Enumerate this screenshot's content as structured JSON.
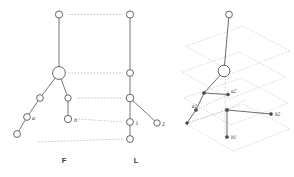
{
  "figure": {
    "title": "",
    "background_color": "#ffffff",
    "stroke_color": "#5a5a5a",
    "dotted_color": "#c0c0c0",
    "panels": [
      {
        "id": "F",
        "label": "F",
        "label_x": 64,
        "label_y": 163
      },
      {
        "id": "L",
        "label": "L",
        "label_x": 136,
        "label_y": 163
      }
    ]
  },
  "panel_f": {
    "name": "F",
    "label": "F",
    "nodes": [
      {
        "id": "f-root",
        "label": "",
        "cx": 59,
        "cy": 14.5,
        "r": 3.6,
        "kind": "circle"
      },
      {
        "id": "f-big",
        "label": "",
        "cx": 59,
        "cy": 73,
        "r": 6.4,
        "kind": "circle"
      },
      {
        "id": "f-mid-l",
        "label": "",
        "cx": 40,
        "cy": 98,
        "r": 3.4,
        "kind": "circle"
      },
      {
        "id": "f-a",
        "label": "a",
        "cx": 27,
        "cy": 117,
        "r": 3.4,
        "kind": "circle"
      },
      {
        "id": "f-leaf-l",
        "label": "",
        "cx": 17,
        "cy": 134,
        "r": 3.4,
        "kind": "circle"
      },
      {
        "id": "f-mid-r",
        "label": "",
        "cx": 68,
        "cy": 98,
        "r": 3.2,
        "kind": "circle"
      },
      {
        "id": "f-b",
        "label": "b",
        "cx": 68,
        "cy": 119,
        "r": 3.6,
        "kind": "circle"
      }
    ],
    "edges": [
      {
        "from": "f-root",
        "to": "f-big"
      },
      {
        "from": "f-big",
        "to": "f-mid-l"
      },
      {
        "from": "f-mid-l",
        "to": "f-a"
      },
      {
        "from": "f-a",
        "to": "f-leaf-l"
      },
      {
        "from": "f-big",
        "to": "f-mid-r"
      },
      {
        "from": "f-mid-r",
        "to": "f-b"
      }
    ],
    "node_labels": [
      {
        "text": "a",
        "x": 32,
        "y": 119.5
      },
      {
        "text": "b",
        "x": 74,
        "y": 121.5
      }
    ]
  },
  "panel_l": {
    "name": "L",
    "label": "L",
    "nodes": [
      {
        "id": "l-root",
        "label": "",
        "cx": 130,
        "cy": 14.5,
        "r": 3.6,
        "kind": "circle"
      },
      {
        "id": "l-n2",
        "label": "",
        "cx": 130,
        "cy": 73,
        "r": 3.4,
        "kind": "circle"
      },
      {
        "id": "l-n3",
        "label": "",
        "cx": 130,
        "cy": 98,
        "r": 3.8,
        "kind": "circle"
      },
      {
        "id": "l-one",
        "label": "1",
        "cx": 130,
        "cy": 122,
        "r": 3.4,
        "kind": "circle"
      },
      {
        "id": "l-bot",
        "label": "",
        "cx": 130,
        "cy": 139,
        "r": 3.4,
        "kind": "circle"
      },
      {
        "id": "l-two",
        "label": "2",
        "cx": 157,
        "cy": 123,
        "r": 3.2,
        "kind": "circle"
      }
    ],
    "edges": [
      {
        "from": "l-root",
        "to": "l-n2"
      },
      {
        "from": "l-n2",
        "to": "l-n3"
      },
      {
        "from": "l-n3",
        "to": "l-one"
      },
      {
        "from": "l-one",
        "to": "l-bot"
      },
      {
        "from": "l-n3",
        "to": "l-two"
      }
    ],
    "node_labels": [
      {
        "text": "1",
        "x": 135.5,
        "y": 124.5
      },
      {
        "text": "2",
        "x": 162,
        "y": 125.5
      }
    ]
  },
  "correspondence_lines": [
    {
      "id": "corr-0",
      "x1": 68,
      "y1": 14.5,
      "x2": 123,
      "y2": 14.5
    },
    {
      "id": "corr-1",
      "x1": 68,
      "y1": 73,
      "x2": 123,
      "y2": 73
    },
    {
      "id": "corr-2",
      "x1": 78,
      "y1": 98,
      "x2": 123,
      "y2": 98
    },
    {
      "id": "corr-3",
      "x1": 78,
      "y1": 119,
      "x2": 123,
      "y2": 122
    },
    {
      "id": "corr-4",
      "x1": 38,
      "y1": 142,
      "x2": 123,
      "y2": 139
    }
  ],
  "panel_3d": {
    "name": "layered-3d-view",
    "planes": [
      {
        "id": "plane-top",
        "points": "186,46 243,26 290,51 233,73"
      },
      {
        "id": "plane-2",
        "points": "182,72 239,52 286,77 229,99"
      },
      {
        "id": "plane-3",
        "points": "184,98 241,78 288,103 231,125"
      },
      {
        "id": "plane-4",
        "points": "186,124 243,104 290,129 233,151"
      }
    ],
    "nodes": [
      {
        "id": "t-root",
        "label": "",
        "cx": 229,
        "cy": 14.5,
        "r": 3.4,
        "kind": "circle"
      },
      {
        "id": "t-big",
        "label": "",
        "cx": 224,
        "cy": 71,
        "r": 5.8,
        "kind": "circle"
      },
      {
        "id": "t-a1",
        "label": "a1",
        "cx": 204,
        "cy": 93,
        "r": 1.6,
        "kind": "dot"
      },
      {
        "id": "t-a2",
        "label": "a2",
        "cx": 228,
        "cy": 94.5,
        "r": 1.6,
        "kind": "dot"
      },
      {
        "id": "t-a",
        "label": "a",
        "cx": 196,
        "cy": 110,
        "r": 1.6,
        "kind": "dot"
      },
      {
        "id": "t-aleaf",
        "label": "",
        "cx": 187,
        "cy": 123,
        "r": 1.5,
        "kind": "dot"
      },
      {
        "id": "t-hub",
        "label": "",
        "cx": 227,
        "cy": 110,
        "r": 1.8,
        "kind": "dot"
      },
      {
        "id": "t-b2",
        "label": "b2",
        "cx": 271,
        "cy": 114,
        "r": 1.6,
        "kind": "dot"
      },
      {
        "id": "t-b1",
        "label": "b1",
        "cx": 227,
        "cy": 137,
        "r": 1.6,
        "kind": "dot"
      }
    ],
    "edges": [
      {
        "from": "t-root",
        "to": "t-big"
      },
      {
        "from": "t-big",
        "to": "t-a1"
      },
      {
        "from": "t-a1",
        "to": "t-a2"
      },
      {
        "from": "t-a1",
        "to": "t-a"
      },
      {
        "from": "t-a",
        "to": "t-aleaf"
      },
      {
        "from": "t-hub",
        "to": "t-b2"
      },
      {
        "from": "t-hub",
        "to": "t-b1"
      }
    ],
    "vertical_axis": {
      "x": 225,
      "y1": 74,
      "y2": 140
    },
    "projection_lines": [
      {
        "id": "proj-a-1",
        "x1": 196,
        "y1": 110,
        "x2": 228,
        "y2": 94.5
      },
      {
        "id": "proj-a-2",
        "x1": 187,
        "y1": 123,
        "x2": 227,
        "y2": 110
      },
      {
        "id": "proj-b-1",
        "x1": 227,
        "y1": 110,
        "x2": 245,
        "y2": 100
      }
    ],
    "labels": [
      {
        "text": "a1",
        "x": 197,
        "y": 108,
        "anchor": "end"
      },
      {
        "text": "a2",
        "x": 231,
        "y": 93,
        "anchor": "start"
      },
      {
        "text": "b2",
        "x": 275,
        "y": 116,
        "anchor": "start"
      },
      {
        "text": "b1",
        "x": 231,
        "y": 139,
        "anchor": "start"
      }
    ]
  }
}
